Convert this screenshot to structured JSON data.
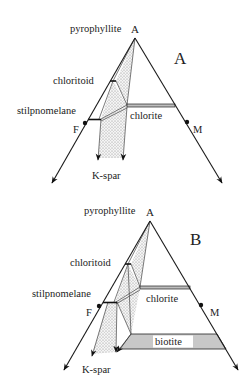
{
  "diagrams": [
    {
      "panel_label": "A",
      "apex_label": "A",
      "apex_phase": "pyrophyllite",
      "left_vertex": "F",
      "right_vertex": "M",
      "phases": [
        "chloritoid",
        "stilpnomelane",
        "chlorite"
      ],
      "arrow_target": "K-spar"
    },
    {
      "panel_label": "B",
      "apex_label": "A",
      "apex_phase": "pyrophyllite",
      "left_vertex": "F",
      "right_vertex": "M",
      "phases": [
        "chloritoid",
        "stilpnomelane",
        "chlorite",
        "biotite"
      ],
      "arrow_target": "K-spar"
    }
  ],
  "colors": {
    "line": "#1a1a1a",
    "stipple": "#bdbdbd",
    "band_fill": "#c8c8c8",
    "background": "#ffffff"
  }
}
